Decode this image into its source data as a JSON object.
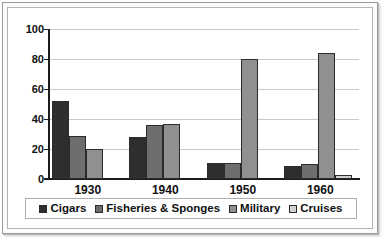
{
  "chart_data": {
    "type": "bar",
    "title": "",
    "xlabel": "",
    "ylabel": "",
    "ylim": [
      0,
      100
    ],
    "yticks": [
      0,
      20,
      40,
      60,
      80,
      100
    ],
    "grid": true,
    "legend_position": "bottom",
    "categories": [
      "1930",
      "1940",
      "1950",
      "1960"
    ],
    "series": [
      {
        "name": "Cigars",
        "color": "#2e2e2e",
        "values": [
          52,
          28,
          11,
          9
        ]
      },
      {
        "name": "Fisheries  & Sponges",
        "color": "#6e6e6e",
        "values": [
          29,
          36,
          11,
          10
        ]
      },
      {
        "name": "Military",
        "color": "#909090",
        "values": [
          20,
          37,
          80,
          84
        ]
      },
      {
        "name": "Cruises",
        "color": "#d0d0d0",
        "values": [
          0,
          0,
          0,
          3
        ]
      }
    ]
  },
  "legend": {
    "items": [
      {
        "label": "Cigars"
      },
      {
        "label": "Fisheries  & Sponges"
      },
      {
        "label": "Military"
      },
      {
        "label": "Cruises"
      }
    ]
  },
  "colors": {
    "series_1": "#2e2e2e",
    "series_2": "#6e6e6e",
    "series_3": "#909090",
    "series_4": "#d0d0d0",
    "gridline": "#c9c9c9",
    "axis": "#1c1c1c",
    "frame": "#9a9a9a",
    "background": "#ffffff"
  }
}
